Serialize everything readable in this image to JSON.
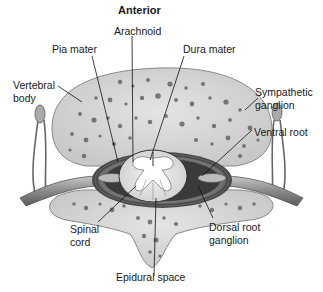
{
  "diagram": {
    "title": "Anterior",
    "labels": {
      "arachnoid": "Arachnoid",
      "pia_mater": "Pia mater",
      "dura_mater": "Dura mater",
      "vertebral_body_1": "Vertebral",
      "vertebral_body_2": "body",
      "sympathetic_ganglion_1": "Sympathetic",
      "sympathetic_ganglion_2": "ganglion",
      "ventral_root": "Ventral root",
      "spinal_cord_1": "Spinal",
      "spinal_cord_2": "cord",
      "dorsal_root_ganglion_1": "Dorsal root",
      "dorsal_root_ganglion_2": "ganglion",
      "epidural_space": "Epidural space"
    },
    "colors": {
      "bone": "#d9d9d9",
      "bone_spots": "#555555",
      "cord": "#ececec",
      "membranes": "#3a3a3a",
      "nerve": "#9a9a9a",
      "text": "#1a1a1a"
    }
  }
}
